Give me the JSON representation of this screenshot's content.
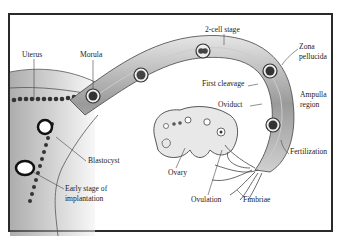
{
  "diagram": {
    "labels": {
      "uterus": "Uterus",
      "morula": "Morula",
      "two_cell_stage": "2-cell stage",
      "zona_pellucida_line1": "Zona",
      "zona_pellucida_line2": "pellucida",
      "first_cleavage": "First cleavage",
      "oviduct": "Oviduct",
      "ampulla_line1": "Ampulla",
      "ampulla_line2": "region",
      "fertilization": "Fertilization",
      "blastocyst": "Blastocyst",
      "implantation_line1": "Early stage of",
      "implantation_line2": "implantation",
      "ovary": "Ovary",
      "ovulation": "Ovulation",
      "fimbriae": "Fimbriae"
    },
    "colors": {
      "frame": "#2a2a2a",
      "tissue_dark": "#5a5a5a",
      "tissue_light": "#d8d8d8",
      "text": "#222222"
    }
  }
}
